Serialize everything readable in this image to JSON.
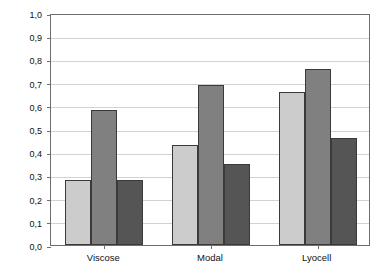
{
  "chart_data": {
    "type": "bar",
    "title": "",
    "xlabel": "",
    "ylabel": "Supermolecular order",
    "categories": [
      "Viscose",
      "Modal",
      "Lyocell"
    ],
    "ylim": [
      0.0,
      1.0
    ],
    "ytick_step": 0.1,
    "ytick_labels": [
      "1,0",
      "0,9",
      "0,8",
      "0,7",
      "0,6",
      "0,5",
      "0,4",
      "0,3",
      "0,2",
      "0,1",
      "0,0"
    ],
    "ytick_values": [
      1.0,
      0.9,
      0.8,
      0.7,
      0.6,
      0.5,
      0.4,
      0.3,
      0.2,
      0.1,
      0.0
    ],
    "grid": true,
    "legend": "none",
    "series": [
      {
        "name": "series-1",
        "color": "#cccccc",
        "values": [
          0.28,
          0.43,
          0.66
        ]
      },
      {
        "name": "series-2",
        "color": "#808080",
        "values": [
          0.58,
          0.69,
          0.76
        ]
      },
      {
        "name": "series-3",
        "color": "#555555",
        "values": [
          0.28,
          0.35,
          0.46
        ]
      }
    ],
    "bar_border_color": "#3a3a3a",
    "gridline_color": "#d2d2d2",
    "axis_color": "#6e6e6e",
    "background_color": "#ffffff"
  }
}
